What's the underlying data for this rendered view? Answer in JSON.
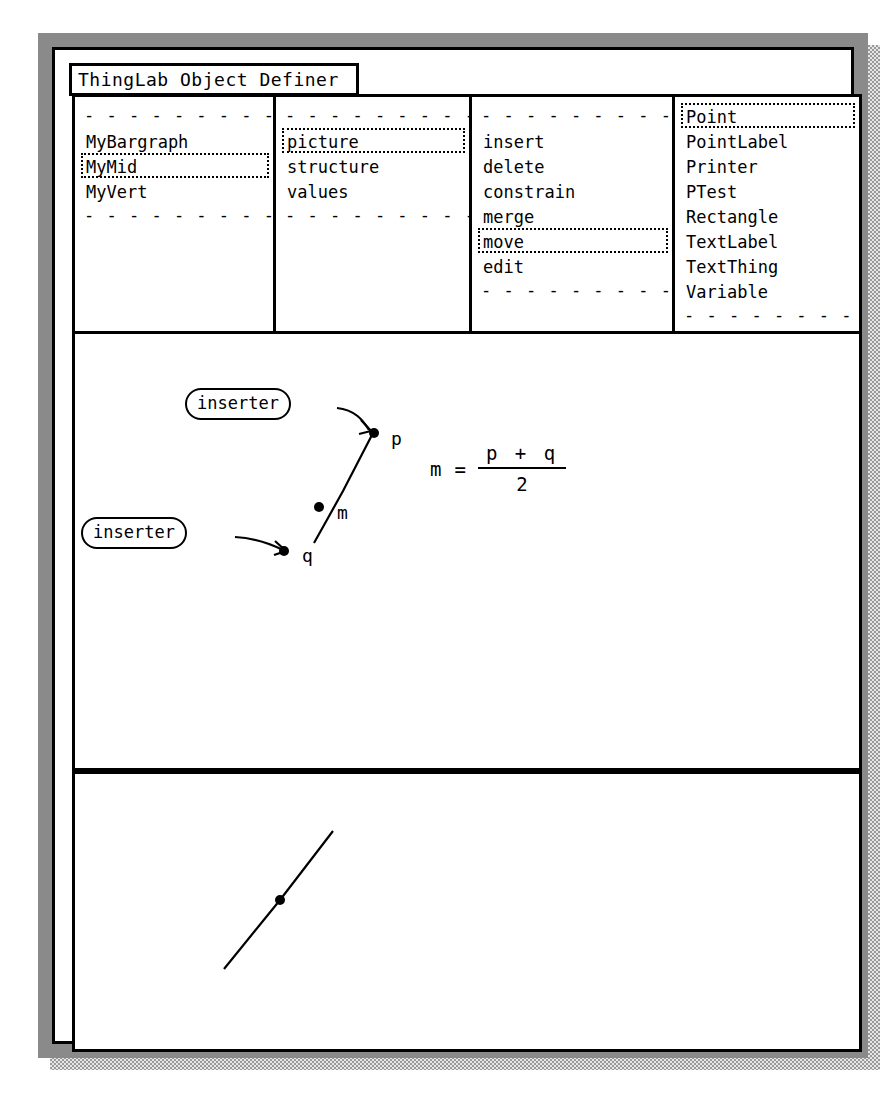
{
  "window": {
    "title": "ThingLab Object Definer"
  },
  "menu": {
    "panes": [
      {
        "name": "objects",
        "top_separator": "- - - - - - - - - - -",
        "items": [
          {
            "label": "MyBargraph",
            "selected": false
          },
          {
            "label": "MyMid",
            "selected": true
          },
          {
            "label": "MyVert",
            "selected": false
          }
        ],
        "bottom_separator": "- - - - - - - - - - -"
      },
      {
        "name": "views",
        "top_separator": "- - - - - - - - - - -",
        "items": [
          {
            "label": "picture",
            "selected": true
          },
          {
            "label": "structure",
            "selected": false
          },
          {
            "label": "values",
            "selected": false
          }
        ],
        "bottom_separator": "- - - - - - - - - - -"
      },
      {
        "name": "actions",
        "top_separator": "- - - - - - - - - - -",
        "items": [
          {
            "label": "insert",
            "selected": false
          },
          {
            "label": "delete",
            "selected": false
          },
          {
            "label": "constrain",
            "selected": false
          },
          {
            "label": "merge",
            "selected": false
          },
          {
            "label": "move",
            "selected": true
          },
          {
            "label": "edit",
            "selected": false
          }
        ],
        "bottom_separator": "- - - - - - - - - - -"
      },
      {
        "name": "classes",
        "top_separator": "",
        "items": [
          {
            "label": "Point",
            "selected": true
          },
          {
            "label": "PointLabel",
            "selected": false
          },
          {
            "label": "Printer",
            "selected": false
          },
          {
            "label": "PTest",
            "selected": false
          },
          {
            "label": "Rectangle",
            "selected": false
          },
          {
            "label": "TextLabel",
            "selected": false
          },
          {
            "label": "TextThing",
            "selected": false
          },
          {
            "label": "Variable",
            "selected": false
          }
        ],
        "bottom_separator": "- - - - - - - - - - -"
      }
    ]
  },
  "picture": {
    "inserters": [
      {
        "label": "inserter"
      },
      {
        "label": "inserter"
      }
    ],
    "points": [
      {
        "label": "p"
      },
      {
        "label": "m"
      },
      {
        "label": "q"
      }
    ],
    "equation": {
      "lhs": "m",
      "operator": "=",
      "numerator": "p + q",
      "denominator": "2"
    }
  },
  "preview": {
    "points": [
      {
        "label": ""
      }
    ]
  },
  "colors": {
    "ink": "#000000",
    "paper": "#ffffff",
    "frame_dark": "#5a5a5a",
    "frame_light": "#d8d8d8"
  }
}
